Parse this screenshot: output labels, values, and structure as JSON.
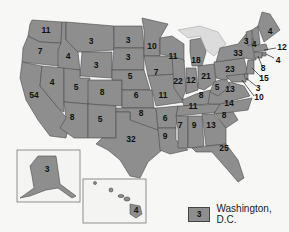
{
  "map": {
    "fill_color": "#8e8e8e",
    "border_color": "#4a4a4a",
    "states": [
      {
        "name": "Washington",
        "value": "11"
      },
      {
        "name": "Oregon",
        "value": "7"
      },
      {
        "name": "California",
        "value": "54"
      },
      {
        "name": "Idaho",
        "value": "4"
      },
      {
        "name": "Nevada",
        "value": "4"
      },
      {
        "name": "Montana",
        "value": "3"
      },
      {
        "name": "Wyoming",
        "value": "3"
      },
      {
        "name": "Utah",
        "value": "5"
      },
      {
        "name": "Arizona",
        "value": "8"
      },
      {
        "name": "Colorado",
        "value": "8"
      },
      {
        "name": "New Mexico",
        "value": "5"
      },
      {
        "name": "North Dakota",
        "value": "3"
      },
      {
        "name": "South Dakota",
        "value": "3"
      },
      {
        "name": "Nebraska",
        "value": "5"
      },
      {
        "name": "Kansas",
        "value": "6"
      },
      {
        "name": "Oklahoma",
        "value": "8"
      },
      {
        "name": "Texas",
        "value": "32"
      },
      {
        "name": "Minnesota",
        "value": "10"
      },
      {
        "name": "Iowa",
        "value": "7"
      },
      {
        "name": "Missouri",
        "value": "11"
      },
      {
        "name": "Arkansas",
        "value": "6"
      },
      {
        "name": "Louisiana",
        "value": "9"
      },
      {
        "name": "Wisconsin",
        "value": "11"
      },
      {
        "name": "Illinois",
        "value": "22"
      },
      {
        "name": "Michigan",
        "value": "18"
      },
      {
        "name": "Indiana",
        "value": "12"
      },
      {
        "name": "Ohio",
        "value": "21"
      },
      {
        "name": "Kentucky",
        "value": "8"
      },
      {
        "name": "Tennessee",
        "value": "11"
      },
      {
        "name": "Mississippi",
        "value": "7"
      },
      {
        "name": "Alabama",
        "value": "9"
      },
      {
        "name": "Georgia",
        "value": "13"
      },
      {
        "name": "Florida",
        "value": "25"
      },
      {
        "name": "South Carolina",
        "value": "8"
      },
      {
        "name": "North Carolina",
        "value": "14"
      },
      {
        "name": "Virginia",
        "value": "13"
      },
      {
        "name": "West Virginia",
        "value": "5"
      },
      {
        "name": "Pennsylvania",
        "value": "23"
      },
      {
        "name": "New York",
        "value": "33"
      },
      {
        "name": "Vermont",
        "value": "3"
      },
      {
        "name": "New Hampshire",
        "value": "4"
      },
      {
        "name": "Maine",
        "value": "4"
      },
      {
        "name": "Massachusetts",
        "value": "12"
      },
      {
        "name": "Rhode Island",
        "value": "4"
      },
      {
        "name": "Connecticut",
        "value": "8"
      },
      {
        "name": "New Jersey",
        "value": "15"
      },
      {
        "name": "Delaware",
        "value": "3"
      },
      {
        "name": "Maryland",
        "value": "10"
      },
      {
        "name": "Alaska",
        "value": "3"
      },
      {
        "name": "Hawaii",
        "value": "4"
      }
    ]
  },
  "legend": {
    "value": "3",
    "label": "Washington, D.C."
  }
}
